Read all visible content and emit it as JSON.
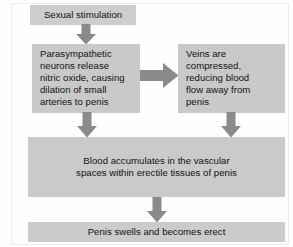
{
  "diagram": {
    "orientation": "top-to-bottom",
    "palette": {
      "box_fill": "#cacaca",
      "arrow_fill": "#8a8a8a",
      "text_color": "#111214",
      "page_background": "#fefefe",
      "frame_border": "#ececed"
    },
    "nodes": [
      {
        "id": "stimulation",
        "label": "Sexual stimulation",
        "align": "center"
      },
      {
        "id": "parasympathetic",
        "label": "Parasympathetic\nneurons release\nnitric oxide, causing\ndilation of small\narteries to penis",
        "align": "left"
      },
      {
        "id": "veins",
        "label": "Veins are\ncompressed,\nreducing blood\nflow away from\npenis",
        "align": "left"
      },
      {
        "id": "accumulates",
        "label": "Blood accumulates in the vascular\nspaces within erectile tissues of penis",
        "align": "center"
      },
      {
        "id": "erect",
        "label": "Penis swells and becomes erect",
        "align": "center"
      }
    ],
    "arrows": [
      {
        "id": "stimulation-to-parasympathetic",
        "direction": "down",
        "from": "stimulation",
        "to": "parasympathetic"
      },
      {
        "id": "parasympathetic-to-veins",
        "direction": "right",
        "from": "parasympathetic",
        "to": "veins"
      },
      {
        "id": "parasympathetic-to-accumulates",
        "direction": "down",
        "from": "parasympathetic",
        "to": "accumulates"
      },
      {
        "id": "veins-to-accumulates",
        "direction": "down",
        "from": "veins",
        "to": "accumulates"
      },
      {
        "id": "accumulates-to-erect",
        "direction": "down",
        "from": "accumulates",
        "to": "erect"
      }
    ]
  }
}
